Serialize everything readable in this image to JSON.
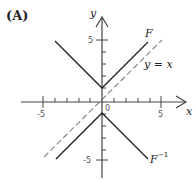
{
  "panel": {
    "label": "(A)"
  },
  "axes": {
    "x_label": "x",
    "y_label": "y",
    "origin_label": "0",
    "x_ticks": [
      "-5",
      "5"
    ],
    "y_ticks": [
      "5",
      "-5"
    ],
    "xlim": [
      -5.5,
      6
    ],
    "ylim": [
      -7,
      7
    ]
  },
  "curves": {
    "F": {
      "label": "F",
      "color": "#222222",
      "vertex": [
        0,
        1
      ],
      "left_end": [
        -5,
        6
      ],
      "right_end": [
        4,
        5
      ]
    },
    "F_inverse": {
      "label": "F",
      "superscript": "−1",
      "color": "#222222",
      "vertex": [
        0,
        -1
      ],
      "left_end": [
        -5,
        -4
      ],
      "right_end": [
        4,
        -5
      ]
    },
    "identity": {
      "label": "y = x",
      "style": "dashed",
      "color": "#888888"
    }
  }
}
